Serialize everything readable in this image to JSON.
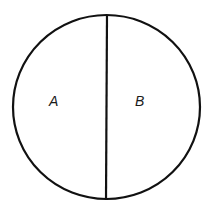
{
  "diagram": {
    "shape": "circle",
    "stroke_color": "#111111",
    "background": "#ffffff",
    "circle": {
      "cx": 106.5,
      "cy": 107,
      "rx": 93.5,
      "ry": 92
    },
    "divider": {
      "x1": 107,
      "y1": 15,
      "x2": 106,
      "y2": 199
    },
    "regions": [
      {
        "id": "A",
        "label": "A",
        "x": 49,
        "y": 106
      },
      {
        "id": "B",
        "label": "B",
        "x": 135,
        "y": 106
      }
    ]
  }
}
